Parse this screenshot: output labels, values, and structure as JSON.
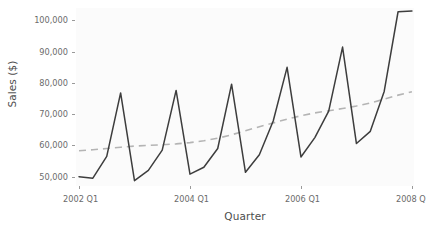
{
  "chart_data": {
    "type": "line",
    "title": "",
    "xlabel": "Quarter",
    "ylabel": "Sales ($)",
    "ylim": [
      47000,
      104000
    ],
    "yticks": [
      50000,
      60000,
      70000,
      80000,
      90000,
      100000
    ],
    "ytick_labels": [
      "50,000",
      "60,000",
      "70,000",
      "80,000",
      "90,000",
      "100,000"
    ],
    "xticks": [
      "2002 Q1",
      "2004 Q1",
      "2006 Q1",
      "2008 Q"
    ],
    "xtick_indices": [
      0,
      8,
      16,
      24
    ],
    "grid": false,
    "legend": "none",
    "x": [
      "2002 Q1",
      "2002 Q2",
      "2002 Q3",
      "2002 Q4",
      "2003 Q1",
      "2003 Q2",
      "2003 Q3",
      "2003 Q4",
      "2004 Q1",
      "2004 Q2",
      "2004 Q3",
      "2004 Q4",
      "2005 Q1",
      "2005 Q2",
      "2005 Q3",
      "2005 Q4",
      "2006 Q1",
      "2006 Q2",
      "2006 Q3",
      "2006 Q4",
      "2007 Q1",
      "2007 Q2",
      "2007 Q3",
      "2007 Q4",
      "2008 Q1"
    ],
    "series": [
      {
        "name": "Sales",
        "style": "solid",
        "color": "#3d3d3d",
        "values": [
          50000,
          49500,
          56500,
          76800,
          48700,
          52000,
          58500,
          77600,
          50800,
          53000,
          59000,
          79600,
          51400,
          57000,
          67800,
          85000,
          56300,
          62500,
          71000,
          91500,
          60600,
          64500,
          77300,
          102800,
          103000
        ]
      },
      {
        "name": "Trend",
        "style": "dashed",
        "color": "#b4b4b4",
        "values": [
          58300,
          58600,
          59000,
          59400,
          59800,
          60000,
          60200,
          60500,
          60900,
          61500,
          62300,
          63400,
          64700,
          66000,
          67200,
          68400,
          69500,
          70400,
          71100,
          71800,
          72600,
          73600,
          74800,
          76100,
          77200
        ]
      }
    ]
  },
  "panel": {
    "background": "#fbfbfb"
  },
  "colors": {
    "series_line": "#3d3d3d",
    "trend_line": "#b4b4b4",
    "tick": "#9a9a9a",
    "tick_text": "#6b6b6b",
    "axis_title": "#4d4d4d",
    "page_background": "#ffffff"
  }
}
